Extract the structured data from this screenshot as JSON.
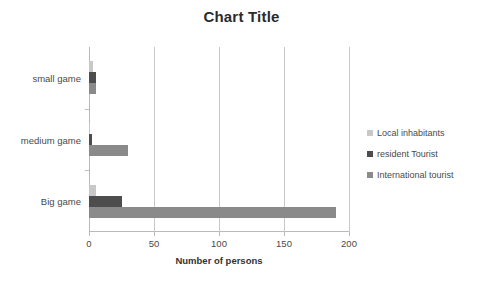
{
  "chart_data": {
    "type": "bar",
    "orientation": "horizontal",
    "title": "Chart Title",
    "xlabel": "Number of persons",
    "ylabel": "",
    "xlim": [
      0,
      200
    ],
    "xticks": [
      0,
      50,
      100,
      150,
      200
    ],
    "xtick_labels": [
      "0",
      "50",
      "100",
      "150",
      "200"
    ],
    "grid": "vertical",
    "legend_position": "right",
    "categories": [
      "small game",
      "medium game",
      "Big game"
    ],
    "series": [
      {
        "name": "Local inhabitants",
        "color": "#c8c8c8",
        "values": [
          3,
          1,
          5
        ]
      },
      {
        "name": "resident Tourist",
        "color": "#4d4d4d",
        "values": [
          5,
          2,
          25
        ]
      },
      {
        "name": "International tourist",
        "color": "#8a8a8a",
        "values": [
          5,
          30,
          190
        ]
      }
    ]
  },
  "legend": {
    "items": [
      {
        "label": "Local inhabitants"
      },
      {
        "label": "resident Tourist"
      },
      {
        "label": "International tourist"
      }
    ]
  }
}
